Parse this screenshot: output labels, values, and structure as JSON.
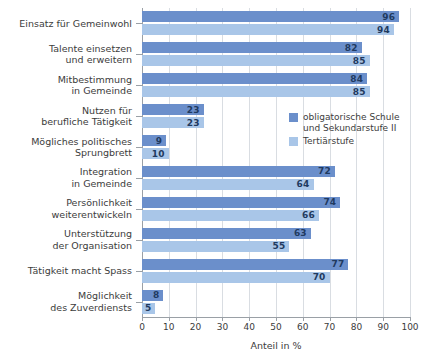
{
  "chart_data": {
    "type": "bar",
    "orientation": "horizontal",
    "title": "",
    "subtitle": "",
    "xlabel": "Anteil in %",
    "ylabel": "",
    "xlim": [
      0,
      100
    ],
    "xticks": [
      0,
      10,
      20,
      30,
      40,
      50,
      60,
      70,
      80,
      90,
      100
    ],
    "xtick_labels": [
      "0",
      "10",
      "20",
      "30",
      "40",
      "50",
      "60",
      "70",
      "80",
      "90",
      "100"
    ],
    "grid": true,
    "grid_axis": "x",
    "legend_position": "upper-right-inside",
    "categories": [
      "Einsatz für Gemeinwohl",
      "Talente einsetzen\nund erweitern",
      "Mitbestimmung\nin Gemeinde",
      "Nutzen für\nberufliche Tätigkeit",
      "Mögliches politisches\nSprungbrett",
      "Integration\nin Gemeinde",
      "Persönlichkeit\nweiterentwickeln",
      "Unterstützung\nder Organisation",
      "Tätigkeit macht Spass",
      "Möglichkeit\ndes Zuverdiensts"
    ],
    "series": [
      {
        "name": "obligatorische Schule\nund Sekundarstufe II",
        "color": "#6b8fcb",
        "values": [
          96,
          82,
          84,
          23,
          9,
          72,
          74,
          63,
          77,
          8
        ]
      },
      {
        "name": "Tertiärstufe",
        "color": "#a9c6e8",
        "values": [
          94,
          85,
          85,
          23,
          10,
          64,
          66,
          55,
          70,
          5
        ]
      }
    ]
  },
  "legend": {
    "items": [
      {
        "label": "obligatorische Schule\nund Sekundarstufe II"
      },
      {
        "label": "Tertiärstufe"
      }
    ]
  },
  "axis": {
    "x_title": "Anteil in %"
  },
  "colors": {
    "series_0": "#6b8fcb",
    "series_1": "#a9c6e8",
    "grid": "#d9dde2",
    "axis": "#9aa0a6",
    "text": "#3c3c3c",
    "value_text": "#1f3a5f"
  }
}
